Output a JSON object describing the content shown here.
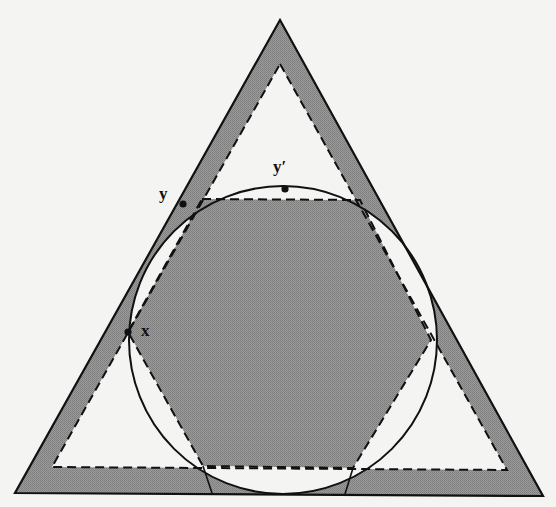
{
  "diagram": {
    "type": "geometry-figure",
    "colors": {
      "background": "#f4f4f2",
      "shade": "#8e8e8e",
      "stroke": "#111111"
    },
    "labels": {
      "x": "x",
      "y": "y",
      "y_prime": "y′"
    },
    "points": {
      "x": {
        "cx": 128,
        "cy": 332
      },
      "y": {
        "cx": 183,
        "cy": 204
      },
      "y_prime": {
        "cx": 285,
        "cy": 189
      }
    },
    "outer_triangle": [
      [
        280,
        20
      ],
      [
        15,
        493
      ],
      [
        543,
        496
      ]
    ],
    "inner_dashed_triangle": [
      [
        280,
        64
      ],
      [
        52,
        467
      ],
      [
        507,
        470
      ]
    ],
    "circle": {
      "cx": 283,
      "cy": 340,
      "r": 154
    },
    "hexagon": [
      [
        202,
        199
      ],
      [
        360,
        200
      ],
      [
        431,
        340
      ],
      [
        353,
        468
      ],
      [
        203,
        466
      ],
      [
        128,
        332
      ]
    ]
  }
}
